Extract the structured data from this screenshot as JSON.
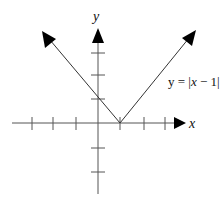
{
  "diagram": {
    "type": "function-graph",
    "axes": {
      "x_label": "x",
      "y_label": "y",
      "x_ticks": [
        -3,
        -2,
        -1,
        1,
        2,
        3
      ],
      "y_ticks": [
        -2,
        -1,
        1,
        2,
        3
      ]
    },
    "function": {
      "label_prefix": "y = |",
      "label_var": "x",
      "label_suffix": " − 1|",
      "expression": "y = |x − 1|",
      "vertex": [
        1,
        0
      ],
      "y_intercept": [
        0,
        1
      ]
    },
    "colors": {
      "line": "#333333",
      "axis": "#555555",
      "arrow": "#000000"
    }
  }
}
